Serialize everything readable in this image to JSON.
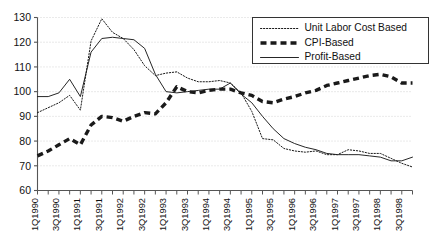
{
  "chart_data": {
    "type": "line",
    "title": "",
    "xlabel": "",
    "ylabel": "",
    "ylim": [
      60,
      130
    ],
    "ytick_step": 10,
    "yticks": [
      60,
      70,
      80,
      90,
      100,
      110,
      120,
      130
    ],
    "grid": true,
    "grid_style": "dotted-horizontal",
    "legend_position": "top-right",
    "x": [
      "1Q1990",
      "2Q1990",
      "3Q1990",
      "4Q1990",
      "1Q1991",
      "2Q1991",
      "3Q1991",
      "4Q1991",
      "1Q1992",
      "2Q1992",
      "3Q1992",
      "4Q1992",
      "1Q1993",
      "2Q1993",
      "3Q1993",
      "4Q1993",
      "1Q1994",
      "2Q1994",
      "3Q1994",
      "4Q1994",
      "1Q1995",
      "2Q1995",
      "3Q1995",
      "4Q1995",
      "1Q1996",
      "2Q1996",
      "3Q1996",
      "4Q1996",
      "1Q1997",
      "2Q1997",
      "3Q1997",
      "4Q1997",
      "1Q1998",
      "2Q1998",
      "3Q1998",
      "4Q1998"
    ],
    "xtick_labels": [
      "1Q1990",
      "3Q1990",
      "1Q1991",
      "3Q1991",
      "1Q1992",
      "3Q1992",
      "1Q1993",
      "3Q1993",
      "1Q1994",
      "3Q1994",
      "1Q1995",
      "3Q1995",
      "1Q1996",
      "3Q1996",
      "1Q1997",
      "3Q1997",
      "1Q1998",
      "3Q1998"
    ],
    "series": [
      {
        "name": "Unit Labor Cost Based",
        "style": "dotted",
        "values": [
          91.5,
          93.5,
          95.5,
          98.5,
          92.5,
          120.5,
          129.5,
          124.0,
          121.5,
          117.0,
          110.5,
          106.5,
          107.5,
          108.0,
          105.5,
          104.0,
          104.0,
          104.5,
          103.5,
          99.5,
          92.0,
          81.0,
          80.5,
          77.0,
          76.0,
          75.5,
          76.0,
          74.5,
          74.5,
          76.5,
          76.0,
          75.0,
          75.0,
          73.0,
          71.0,
          69.5
        ]
      },
      {
        "name": "CPI-Based",
        "style": "dashed",
        "values": [
          74.0,
          76.0,
          78.5,
          81.0,
          78.5,
          86.5,
          90.0,
          89.5,
          88.0,
          90.0,
          91.5,
          91.0,
          95.5,
          102.0,
          100.0,
          99.5,
          100.5,
          101.0,
          101.0,
          99.5,
          98.5,
          96.0,
          95.5,
          97.0,
          98.0,
          99.5,
          100.5,
          102.5,
          103.5,
          104.5,
          105.5,
          106.5,
          107.0,
          106.0,
          103.5,
          103.5
        ]
      },
      {
        "name": "Profit-Based",
        "style": "solid",
        "values": [
          98.0,
          98.0,
          99.5,
          105.0,
          98.0,
          116.0,
          121.5,
          122.0,
          121.5,
          121.0,
          117.5,
          107.0,
          100.0,
          99.5,
          100.0,
          100.5,
          101.0,
          101.0,
          103.5,
          99.0,
          95.5,
          90.0,
          85.0,
          81.0,
          79.0,
          77.5,
          76.5,
          75.0,
          74.5,
          74.5,
          74.5,
          74.0,
          73.5,
          72.0,
          72.0,
          73.5
        ]
      }
    ]
  },
  "legend": {
    "items": [
      {
        "label": "Unit Labor Cost Based",
        "style": "dotted"
      },
      {
        "label": "CPI-Based",
        "style": "dashed"
      },
      {
        "label": "Profit-Based",
        "style": "solid"
      }
    ]
  },
  "colors": {
    "axis": "#555555",
    "grid": "#c9c9c9",
    "series_line": "#1a1a1a",
    "background": "#ffffff",
    "legend_border": "#333333"
  }
}
